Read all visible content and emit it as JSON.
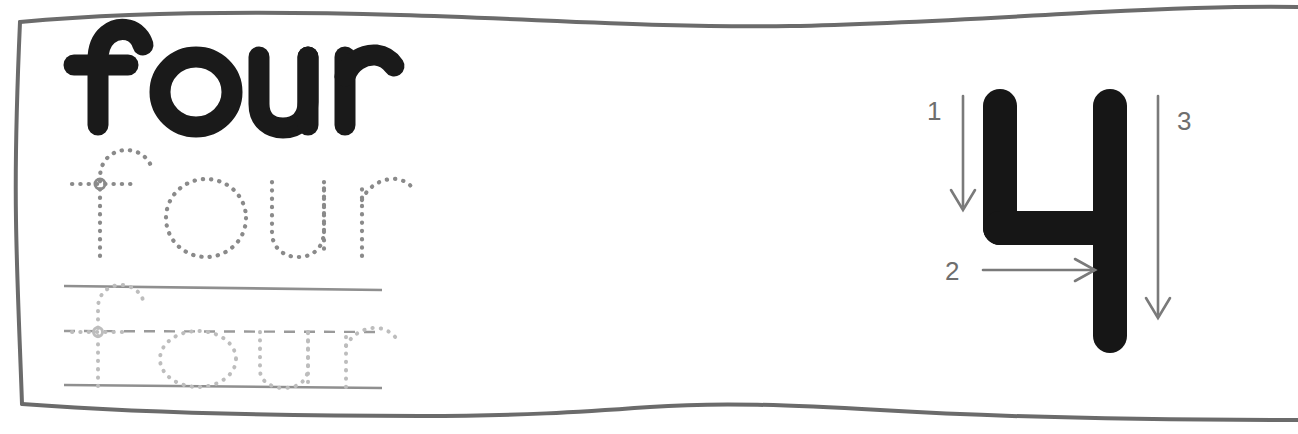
{
  "worksheet": {
    "title": "four",
    "border_color": "#6b6b6b",
    "ink_color": "#1a1a1a",
    "trace_color": "#8a8a8a",
    "rule_color": "#8f8f8f",
    "arrow_color": "#7a7a7a",
    "background_color": "#ffffff"
  },
  "practice_rows": [
    {
      "name": "solid-word",
      "text": "four",
      "style": "solid-bold",
      "ruled": false
    },
    {
      "name": "dotted-word",
      "text": "four",
      "style": "dotted-trace",
      "ruled": false
    },
    {
      "name": "ruled-dotted-word",
      "text": "four",
      "style": "dotted-trace",
      "ruled": true,
      "lines": [
        {
          "name": "top-line",
          "type": "solid"
        },
        {
          "name": "mid-line",
          "type": "dashed"
        },
        {
          "name": "base-line",
          "type": "solid"
        }
      ]
    }
  ],
  "numeral": {
    "value": "4",
    "label": "numeral-four",
    "stroke_order": [
      {
        "number": "1",
        "direction": "down",
        "label_side": "left"
      },
      {
        "number": "2",
        "direction": "right",
        "label_side": "left"
      },
      {
        "number": "3",
        "direction": "down",
        "label_side": "right"
      }
    ]
  }
}
